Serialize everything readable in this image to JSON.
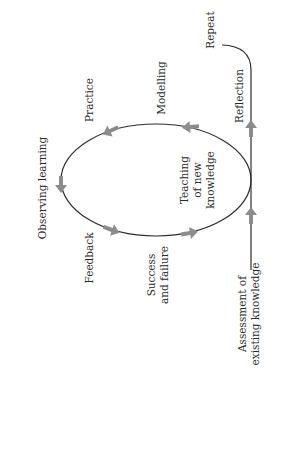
{
  "diagram": {
    "orientation": "rotated-90-ccw",
    "colors": {
      "line": "#2e2e2e",
      "arrow": "#8c8c8c",
      "text": "#2a2a2a",
      "background": "#ffffff"
    },
    "cycle_labels": {
      "teaching": [
        "Teaching",
        "of new",
        "knowledge"
      ],
      "modelling": "Modelling",
      "practice": "Practice",
      "observing": "Observing learning",
      "feedback": "Feedback",
      "success": [
        "Success",
        "and failure"
      ]
    },
    "entry_label": [
      "Assessment of",
      "existing knowledge"
    ],
    "reflection_label": "Reflection",
    "repeat_label": "Repeat"
  }
}
